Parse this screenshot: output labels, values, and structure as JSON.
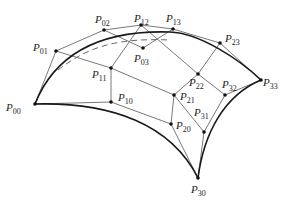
{
  "diagram": {
    "type": "bicubic-bezier-patch",
    "points": [
      {
        "id": "P00",
        "base": "P",
        "sub": "00",
        "x": 35,
        "y": 104,
        "lx": 6,
        "ly": 111
      },
      {
        "id": "P01",
        "base": "P",
        "sub": "01",
        "x": 56,
        "y": 51,
        "lx": 33,
        "ly": 51
      },
      {
        "id": "P02",
        "base": "P",
        "sub": "02",
        "x": 104,
        "y": 30,
        "lx": 95,
        "ly": 23
      },
      {
        "id": "P03",
        "base": "P",
        "sub": "03",
        "x": 143,
        "y": 48,
        "lx": 134,
        "ly": 62
      },
      {
        "id": "P10",
        "base": "P",
        "sub": "10",
        "x": 111,
        "y": 102,
        "lx": 118,
        "ly": 101
      },
      {
        "id": "P11",
        "base": "P",
        "sub": "11",
        "x": 111,
        "y": 68,
        "lx": 92,
        "ly": 78
      },
      {
        "id": "P12",
        "base": "P",
        "sub": "12",
        "x": 141,
        "y": 25,
        "lx": 134,
        "ly": 22
      },
      {
        "id": "P13",
        "base": "P",
        "sub": "13",
        "x": 173,
        "y": 29,
        "lx": 166,
        "ly": 22
      },
      {
        "id": "P20",
        "base": "P",
        "sub": "20",
        "x": 171,
        "y": 124,
        "lx": 176,
        "ly": 129
      },
      {
        "id": "P21",
        "base": "P",
        "sub": "21",
        "x": 174,
        "y": 95,
        "lx": 180,
        "ly": 100
      },
      {
        "id": "P22",
        "base": "P",
        "sub": "22",
        "x": 198,
        "y": 74,
        "lx": 189,
        "ly": 86
      },
      {
        "id": "P23",
        "base": "P",
        "sub": "23",
        "x": 220,
        "y": 43,
        "lx": 225,
        "ly": 42
      },
      {
        "id": "P30",
        "base": "P",
        "sub": "30",
        "x": 198,
        "y": 178,
        "lx": 191,
        "ly": 193
      },
      {
        "id": "P31",
        "base": "P",
        "sub": "31",
        "x": 204,
        "y": 132,
        "lx": 194,
        "ly": 116
      },
      {
        "id": "P32",
        "base": "P",
        "sub": "32",
        "x": 225,
        "y": 95,
        "lx": 222,
        "ly": 88
      },
      {
        "id": "P33",
        "base": "P",
        "sub": "33",
        "x": 261,
        "y": 80,
        "lx": 263,
        "ly": 86
      }
    ],
    "control_polygon_rows": [
      [
        "P00",
        "P01",
        "P02",
        "P03"
      ],
      [
        "P10",
        "P11",
        "P12",
        "P13"
      ],
      [
        "P20",
        "P21",
        "P22",
        "P23"
      ],
      [
        "P30",
        "P31",
        "P32",
        "P33"
      ]
    ],
    "boundary_curves": [
      "M35,104 C56,51 104,30 170,32",
      "M170,32 C200,33 240,60 261,80",
      "M35,104 C111,102 171,124 198,178",
      "M198,178 C204,132 225,95 261,80"
    ],
    "hidden_curve": "M58,70 C90,45 120,38 170,40",
    "colors": {
      "line": "#555555",
      "boundary": "#1a1a1a",
      "point": "#111111",
      "label": "#222222",
      "background": "#ffffff"
    }
  }
}
